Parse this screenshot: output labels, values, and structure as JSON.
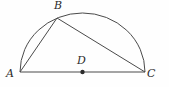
{
  "figure": {
    "type": "geometry-diagram",
    "background_color": "#fefefe",
    "stroke_color": "#4a4a4a",
    "label_color": "#2b2b2b",
    "canvas": {
      "width": 169,
      "height": 87
    },
    "points": [
      {
        "name": "A",
        "label": "A",
        "x": 20,
        "y": 72,
        "label_x": 6,
        "label_y": 68,
        "marked_dot": false
      },
      {
        "name": "B",
        "label": "B",
        "x": 57,
        "y": 18,
        "label_x": 54,
        "label_y": 0,
        "marked_dot": false
      },
      {
        "name": "C",
        "label": "C",
        "x": 145,
        "y": 72,
        "label_x": 147,
        "label_y": 68,
        "marked_dot": false
      },
      {
        "name": "D",
        "label": "D",
        "x": 82.5,
        "y": 72,
        "label_x": 77,
        "label_y": 55,
        "marked_dot": true
      }
    ],
    "segments": [
      {
        "name": "AC",
        "from": "A",
        "to": "C"
      },
      {
        "name": "AB",
        "from": "A",
        "to": "B"
      },
      {
        "name": "BC",
        "from": "B",
        "to": "C"
      }
    ],
    "arc": {
      "name": "arc-A-to-C",
      "from": "A",
      "to": "C",
      "center": "D",
      "rx": 62.5,
      "ry": 59,
      "sweep": "upper"
    },
    "dot_radius": 2.2,
    "stroke_width": 1
  }
}
